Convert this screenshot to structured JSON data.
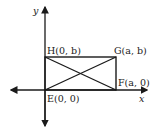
{
  "diagram": {
    "axes": {
      "x_label": "x",
      "y_label": "y"
    },
    "points": [
      {
        "name": "H",
        "label": "H(0, b)",
        "x": 0,
        "y": "b"
      },
      {
        "name": "G",
        "label": "G(a, b)",
        "x": "a",
        "y": "b"
      },
      {
        "name": "F",
        "label": "F(a, 0)",
        "x": "a",
        "y": 0
      },
      {
        "name": "E",
        "label": "E(0, 0)",
        "x": 0,
        "y": 0
      }
    ],
    "shape": "rectangle EFGH with diagonals EG and HF",
    "colors": {
      "stroke": "#1a1a1a",
      "background": "#ffffff"
    }
  }
}
